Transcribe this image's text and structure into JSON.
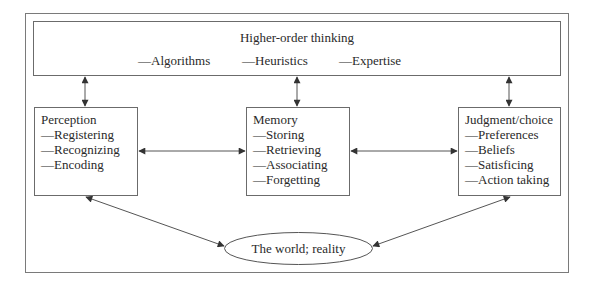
{
  "diagram": {
    "higher_order": {
      "title": "Higher-order thinking",
      "items": [
        "—Algorithms",
        "—Heuristics",
        "—Expertise"
      ]
    },
    "perception": {
      "title": "Perception",
      "items": [
        "—Registering",
        "—Recognizing",
        "—Encoding"
      ]
    },
    "memory": {
      "title": "Memory",
      "items": [
        "—Storing",
        "—Retrieving",
        "—Associating",
        "—Forgetting"
      ]
    },
    "judgment": {
      "title": "Judgment/choice",
      "items": [
        "—Preferences",
        "—Beliefs",
        "—Satisficing",
        "—Action taking"
      ]
    },
    "world": {
      "label": "The world; reality"
    },
    "connections": [
      {
        "from": "higher_order",
        "to": "perception",
        "type": "bidirectional"
      },
      {
        "from": "higher_order",
        "to": "memory",
        "type": "bidirectional"
      },
      {
        "from": "higher_order",
        "to": "judgment",
        "type": "bidirectional"
      },
      {
        "from": "perception",
        "to": "memory",
        "type": "bidirectional"
      },
      {
        "from": "memory",
        "to": "judgment",
        "type": "bidirectional"
      },
      {
        "from": "perception",
        "to": "world",
        "type": "bidirectional"
      },
      {
        "from": "judgment",
        "to": "world",
        "type": "bidirectional"
      }
    ],
    "colors": {
      "line": "#555555",
      "border": "#6b6b6b",
      "text": "#2a2a2a",
      "background": "#ffffff"
    }
  }
}
